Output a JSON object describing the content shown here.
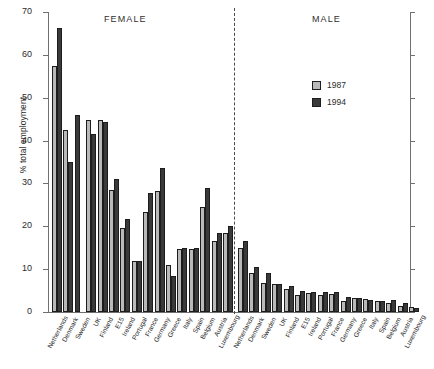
{
  "chart_data": {
    "type": "bar",
    "title": "",
    "xlabel": "",
    "ylabel": "% total employment",
    "ylim": [
      0,
      70
    ],
    "yticks": [
      0,
      10,
      20,
      30,
      40,
      50,
      60,
      70
    ],
    "grid": false,
    "legend_position": "upper-right-inside",
    "panel_labels": [
      "FEMALE",
      "MALE"
    ],
    "legend": [
      "1987",
      "1994"
    ],
    "colors": {
      "1987": "#b9b9b9",
      "1994": "#3a3a3a",
      "axis": "#707070",
      "text": "#232323"
    },
    "panels": [
      {
        "name": "FEMALE",
        "categories": [
          "Netherlands",
          "Denmark",
          "Sweden",
          "UK",
          "Finland",
          "E15",
          "Ireland",
          "Portugal",
          "France",
          "Germany",
          "Greece",
          "Italy",
          "Spain",
          "Belgium",
          "Austria",
          "Luxembourg"
        ],
        "series": [
          {
            "name": "1987",
            "values": [
              57.3,
              42.4,
              null,
              44.8,
              44.8,
              28.5,
              19.5,
              12.0,
              23.4,
              28.3,
              11.0,
              14.7,
              14.6,
              24.6,
              16.5,
              18.4
            ]
          },
          {
            "name": "1994",
            "values": [
              66.2,
              35.0,
              46.0,
              41.6,
              44.4,
              31.0,
              21.6,
              12.0,
              27.7,
              33.6,
              8.3,
              15.0,
              15.0,
              29.0,
              18.4,
              20.0
            ]
          }
        ]
      },
      {
        "name": "MALE",
        "categories": [
          "Netherlands",
          "Denmark",
          "Sweden",
          "UK",
          "Finland",
          "E15",
          "Ireland",
          "Portugal",
          "France",
          "Germany",
          "Greece",
          "Italy",
          "Spain",
          "Belgium",
          "Austria",
          "Luxembourg"
        ],
        "series": [
          {
            "name": "1987",
            "values": [
              15.0,
              9.0,
              6.8,
              6.5,
              5.3,
              4.0,
              4.4,
              4.0,
              4.2,
              2.6,
              3.3,
              3.0,
              2.5,
              2.0,
              1.5,
              1.1
            ]
          },
          {
            "name": "1994",
            "values": [
              16.5,
              10.5,
              9.0,
              6.6,
              6.0,
              5.0,
              4.6,
              4.6,
              4.6,
              3.4,
              3.2,
              2.9,
              2.6,
              2.7,
              2.2,
              1.0
            ]
          }
        ]
      }
    ]
  }
}
